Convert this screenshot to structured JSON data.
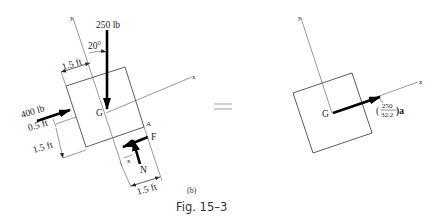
{
  "figure": {
    "caption": "Fig. 15–3",
    "sub_label": "(b)",
    "equals_sign": "="
  },
  "fbd": {
    "axis_x_label": "x",
    "axis_y_label": "y",
    "center_label": "G",
    "point_a_label": "A",
    "top_force": {
      "label": "250 lb",
      "angle_label": "20°"
    },
    "left_force": {
      "label": "400 lb"
    },
    "friction_label": "F",
    "normal_label": "N",
    "x_dim_label": "x",
    "dims": {
      "top_width": "1.5 ft",
      "left_offset": "0.5 ft",
      "left_height": "1.5 ft",
      "bottom_width": "1.5 ft"
    }
  },
  "kinetic": {
    "axis_x_label": "x",
    "axis_y_label": "y",
    "center_label": "G",
    "mass_numerator": "250",
    "mass_denominator": "32.2",
    "mass_open": "(",
    "mass_close": ")a"
  }
}
